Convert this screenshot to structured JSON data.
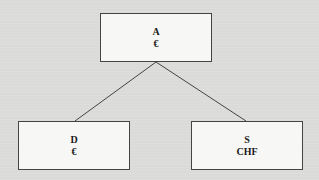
{
  "diagram": {
    "type": "tree",
    "nodes": [
      {
        "id": "A",
        "name": "A",
        "currency": "€"
      },
      {
        "id": "D",
        "name": "D",
        "currency": "€"
      },
      {
        "id": "S",
        "name": "S",
        "currency": "CHF"
      }
    ],
    "edges": [
      {
        "from": "A",
        "to": "D"
      },
      {
        "from": "A",
        "to": "S"
      }
    ]
  },
  "colors": {
    "background": "#dcdcda",
    "box_fill": "#f7f7f5",
    "line": "#444444",
    "text": "#1a1a1a"
  }
}
